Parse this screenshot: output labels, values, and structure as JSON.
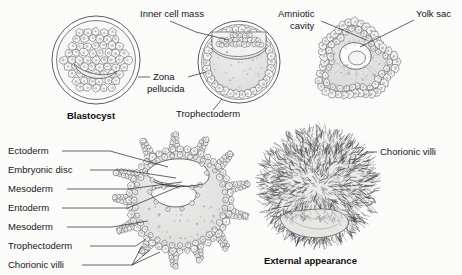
{
  "figure": {
    "background_color": "#fbfbfa",
    "ink_color": "#16161a",
    "fill_gray": "#e3e3e1"
  },
  "panels": [
    {
      "id": "blastocyst-early",
      "caption": "Blastocyst",
      "caption_bold": true,
      "center": [
        96,
        60
      ],
      "radius": 44
    },
    {
      "id": "blastocyst-late",
      "caption": "",
      "center": [
        239,
        62
      ],
      "radius": 41
    },
    {
      "id": "implanting-embryo",
      "caption": "",
      "center": [
        355,
        62
      ],
      "radius": 45
    },
    {
      "id": "embryo-section",
      "caption": "",
      "center": [
        180,
        200
      ],
      "radius": 60
    },
    {
      "id": "external-view",
      "caption": "External appearance",
      "caption_bold": true,
      "center": [
        318,
        190
      ],
      "radius": 62
    }
  ],
  "labels": [
    {
      "id": "inner-cell-mass",
      "text": "Inner cell mass",
      "x": 140,
      "y": 17,
      "anchor": "start"
    },
    {
      "id": "zona-pellucida-line1",
      "text": "Zona",
      "x": 153,
      "y": 80,
      "anchor": "start"
    },
    {
      "id": "zona-pellucida-line2",
      "text": "pellucida",
      "x": 147,
      "y": 92,
      "anchor": "start"
    },
    {
      "id": "trophectoderm-top",
      "text": "Trophectoderm",
      "x": 176,
      "y": 117,
      "anchor": "start"
    },
    {
      "id": "blastocyst-caption",
      "text": "Blastocyst",
      "x": 67,
      "y": 119,
      "anchor": "start",
      "bold": true
    },
    {
      "id": "amniotic-cavity-line1",
      "text": "Amniotic",
      "x": 278,
      "y": 17,
      "anchor": "start"
    },
    {
      "id": "amniotic-cavity-line2",
      "text": "cavity",
      "x": 290,
      "y": 29,
      "anchor": "start"
    },
    {
      "id": "yolk-sac",
      "text": "Yolk sac",
      "x": 416,
      "y": 17,
      "anchor": "start"
    },
    {
      "id": "ectoderm",
      "text": "Ectoderm",
      "x": 8,
      "y": 154,
      "anchor": "start"
    },
    {
      "id": "embryonic-disc",
      "text": "Embryonic disc",
      "x": 8,
      "y": 173,
      "anchor": "start"
    },
    {
      "id": "mesoderm-upper",
      "text": "Mesoderm",
      "x": 8,
      "y": 192,
      "anchor": "start"
    },
    {
      "id": "entoderm",
      "text": "Entoderm",
      "x": 8,
      "y": 211,
      "anchor": "start"
    },
    {
      "id": "mesoderm-lower",
      "text": "Mesoderm",
      "x": 8,
      "y": 230,
      "anchor": "start"
    },
    {
      "id": "trophectoderm-bottom",
      "text": "Trophectoderm",
      "x": 8,
      "y": 249,
      "anchor": "start"
    },
    {
      "id": "chorionic-villi-left",
      "text": "Chorionic villi",
      "x": 8,
      "y": 268,
      "anchor": "start"
    },
    {
      "id": "chorionic-villi-right",
      "text": "Chorionic villi",
      "x": 380,
      "y": 155,
      "anchor": "start"
    },
    {
      "id": "external-appearance",
      "text": "External appearance",
      "x": 264,
      "y": 264,
      "anchor": "start",
      "bold": true
    }
  ]
}
